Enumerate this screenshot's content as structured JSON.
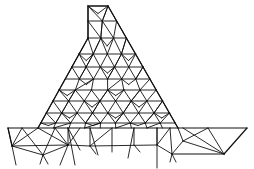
{
  "figure": {
    "title": "",
    "colors": {
      "background": "#ffffff",
      "stroke": "#111111"
    },
    "stroke_width": 1.1
  },
  "mesh": {
    "outline": {
      "dam": [
        [
          88,
          6
        ],
        [
          108,
          6
        ],
        [
          178,
          128
        ],
        [
          38,
          128
        ],
        [
          88,
          38
        ]
      ],
      "foundation_top": [
        [
          8,
          128
        ],
        [
          247,
          128
        ]
      ],
      "foundation_right": [
        [
          247,
          128
        ],
        [
          224,
          154
        ],
        [
          174,
          154
        ]
      ]
    },
    "horizontal_levels": [
      21,
      38,
      54,
      67,
      79,
      90,
      101,
      113,
      123
    ],
    "foundation_nodes": [
      [
        12,
        146
      ],
      [
        43,
        155
      ],
      [
        68,
        145
      ],
      [
        90,
        146
      ],
      [
        134,
        145
      ],
      [
        157,
        145
      ],
      [
        172,
        154
      ],
      [
        224,
        154
      ],
      [
        183,
        141
      ],
      [
        208,
        128
      ]
    ]
  }
}
